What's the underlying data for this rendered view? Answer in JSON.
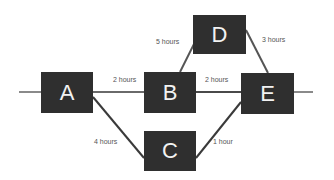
{
  "colors": {
    "node_fill": "#2f2f2f",
    "node_text": "#f2f2f2",
    "edge_main": "#8a8a8a",
    "edge_dark": "#3a3a3a",
    "label_text": "#555555",
    "background": "#ffffff"
  },
  "nodes": [
    {
      "id": "A",
      "label": "A",
      "x": 41,
      "y": 72,
      "w": 52,
      "h": 41
    },
    {
      "id": "B",
      "label": "B",
      "x": 144,
      "y": 72,
      "w": 52,
      "h": 41
    },
    {
      "id": "C",
      "label": "C",
      "x": 144,
      "y": 131,
      "w": 52,
      "h": 40
    },
    {
      "id": "D",
      "label": "D",
      "x": 193,
      "y": 15,
      "w": 53,
      "h": 39
    },
    {
      "id": "E",
      "label": "E",
      "x": 241,
      "y": 73,
      "w": 53,
      "h": 41
    }
  ],
  "edges": [
    {
      "from": "start",
      "to": "A",
      "label": ""
    },
    {
      "from": "A",
      "to": "B",
      "label": "2 hours"
    },
    {
      "from": "B",
      "to": "E",
      "label": "2 hours"
    },
    {
      "from": "E",
      "to": "end",
      "label": ""
    },
    {
      "from": "B",
      "to": "D",
      "label": "5 hours"
    },
    {
      "from": "D",
      "to": "E",
      "label": "3 hours"
    },
    {
      "from": "A",
      "to": "C",
      "label": "4 hours"
    },
    {
      "from": "C",
      "to": "E",
      "label": "1 hour"
    }
  ],
  "labels": {
    "a_b": "2 hours",
    "b_e": "2 hours",
    "b_d": "5 hours",
    "d_e": "3 hours",
    "a_c": "4 hours",
    "c_e": "1 hour"
  }
}
